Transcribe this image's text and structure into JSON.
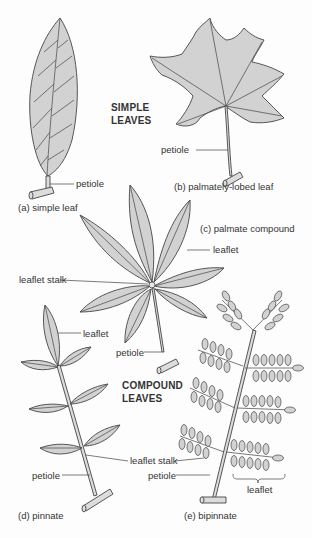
{
  "figure": {
    "colors": {
      "background": "#fdfdfd",
      "leaf_fill": "#d2d2d2",
      "outline": "#454545",
      "text": "#333333"
    },
    "group_headers": {
      "simple": [
        "SIMPLE",
        "LEAVES"
      ],
      "compound": [
        "COMPOUND",
        "LEAVES"
      ]
    },
    "panels": {
      "a": {
        "caption": "(a) simple leaf",
        "labels": {
          "petiole": "petiole"
        }
      },
      "b": {
        "caption": "(b) palmately-lobed leaf",
        "labels": {
          "petiole": "petiole"
        }
      },
      "c": {
        "caption": "(c) palmate compound",
        "labels": {
          "leaflet": "leaflet",
          "leaflet_stalk": "leaflet stalk",
          "petiole": "petiole"
        }
      },
      "d": {
        "caption": "(d) pinnate",
        "labels": {
          "leaflet": "leaflet",
          "leaflet_stalk": "leaflet stalk",
          "petiole": "petiole"
        }
      },
      "e": {
        "caption": "(e) bipinnate",
        "labels": {
          "petiole": "petiole",
          "leaflet": "leaflet"
        }
      }
    }
  }
}
